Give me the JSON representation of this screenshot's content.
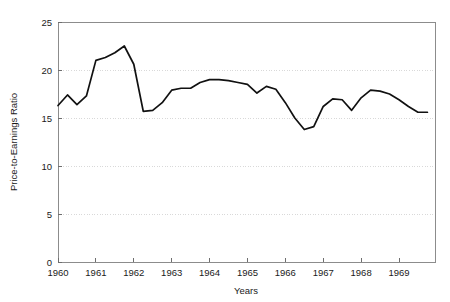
{
  "chart_data": {
    "type": "line",
    "title": "",
    "subtitle": "",
    "xlabel": "Years",
    "ylabel": "Price-to-Earnings Ratio",
    "xlim": [
      1960,
      1969.95
    ],
    "ylim": [
      0,
      25
    ],
    "grid": true,
    "grid_axis": "y",
    "legend": false,
    "legend_position": "none",
    "x_tick_labels": [
      "1960",
      "1961",
      "1962",
      "1963",
      "1964",
      "1965",
      "1966",
      "1967",
      "1968",
      "1969"
    ],
    "x_tick_values": [
      1960,
      1961,
      1962,
      1963,
      1964,
      1965,
      1966,
      1967,
      1968,
      1969
    ],
    "y_tick_labels": [
      "0",
      "5",
      "10",
      "15",
      "20",
      "25"
    ],
    "y_tick_values": [
      0,
      5,
      10,
      15,
      20,
      25
    ],
    "series": [
      {
        "name": "Price-to-Earnings Ratio",
        "color": "#111111",
        "x": [
          1960.0,
          1960.25,
          1960.5,
          1960.75,
          1961.0,
          1961.25,
          1961.5,
          1961.75,
          1962.0,
          1962.25,
          1962.5,
          1962.75,
          1963.0,
          1963.25,
          1963.5,
          1963.75,
          1964.0,
          1964.25,
          1964.5,
          1964.75,
          1965.0,
          1965.25,
          1965.5,
          1965.75,
          1966.0,
          1966.25,
          1966.5,
          1966.75,
          1967.0,
          1967.25,
          1967.5,
          1967.75,
          1968.0,
          1968.25,
          1968.5,
          1968.75,
          1969.0,
          1969.25,
          1969.5,
          1969.75
        ],
        "values": [
          16.3,
          17.4,
          16.4,
          17.3,
          21.0,
          21.3,
          21.8,
          22.5,
          20.6,
          15.7,
          15.8,
          16.6,
          17.9,
          18.1,
          18.1,
          18.7,
          19.0,
          19.0,
          18.9,
          18.7,
          18.5,
          17.6,
          18.3,
          18.0,
          16.6,
          15.0,
          13.8,
          14.1,
          16.2,
          17.0,
          16.9,
          15.8,
          17.1,
          17.9,
          17.8,
          17.5,
          16.9,
          16.2,
          15.6,
          15.6
        ]
      }
    ]
  },
  "figure": {
    "background_color": "#ffffff",
    "frame_color": "#8c8c8c",
    "grid_color": "#cfcfcf",
    "line_color": "#111111"
  }
}
